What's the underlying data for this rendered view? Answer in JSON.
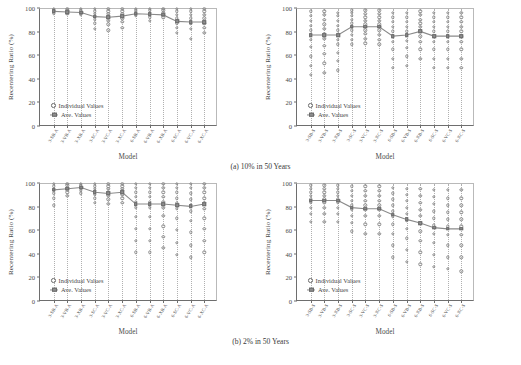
{
  "figure": {
    "subcaptions": [
      {
        "id": "a",
        "text": "(a) 10% in 50 Years"
      },
      {
        "id": "b",
        "text": "(b) 2% in 50 Years"
      }
    ]
  },
  "legend": {
    "individual_label": "Individual Values",
    "average_label": "Ave. Values"
  },
  "axis": {
    "ylabel": "Recentering Ratio (%)",
    "xlabel": "Model",
    "yticks": [
      0,
      20,
      40,
      60,
      80,
      100
    ],
    "ylim": [
      0,
      100
    ]
  },
  "colors": {
    "marker_edge": "#8a8a8a",
    "average_fill": "#8f8f8f",
    "line": "#8a8a8a",
    "grid": "#b0b0b0",
    "axis": "#6e6e6e",
    "text": "#4a4a4a"
  },
  "chart_data": [
    {
      "id": "panel-a-left",
      "type": "scatter",
      "title": "",
      "xlabel": "Model",
      "ylabel": "Recentering Ratio (%)",
      "ylim": [
        0,
        100
      ],
      "grid": true,
      "legend_position": "lower-left",
      "categories": [
        "3-SB-A",
        "3-VB-A",
        "3-XB-A",
        "3-SC-A",
        "3-VC-A",
        "3-XC-A",
        "6-SB-A",
        "6-VB-A",
        "6-XB-A",
        "6-SC-A",
        "6-VC-A",
        "6-XC-A"
      ],
      "series": [
        {
          "name": "Ave. Values",
          "values": [
            98,
            97.5,
            97,
            93.5,
            93,
            94,
            96,
            95.5,
            95,
            89.5,
            89,
            89
          ]
        }
      ],
      "individual_values": [
        [
          100,
          99,
          98.5,
          98,
          97.5,
          96.5
        ],
        [
          100,
          99,
          98,
          97.5,
          97,
          96
        ],
        [
          100,
          99,
          98,
          97,
          96.5,
          95
        ],
        [
          100,
          98,
          96,
          94,
          91,
          88,
          83
        ],
        [
          100,
          98,
          96,
          93,
          90,
          87,
          82
        ],
        [
          100,
          98,
          96,
          94,
          92,
          89,
          84
        ],
        [
          100,
          99,
          97.5,
          96.5,
          95.5,
          94
        ],
        [
          100,
          99,
          97,
          96,
          95,
          93,
          90
        ],
        [
          100,
          99,
          97,
          96,
          94.5,
          93
        ],
        [
          100,
          98,
          95,
          92,
          88,
          84,
          80
        ],
        [
          100,
          98,
          95,
          92,
          88,
          83,
          75
        ],
        [
          100,
          98,
          95,
          92,
          88,
          84,
          80
        ]
      ]
    },
    {
      "id": "panel-a-right",
      "type": "scatter",
      "title": "",
      "xlabel": "Model",
      "ylabel": "Recentering Ratio (%)",
      "ylim": [
        0,
        100
      ],
      "grid": true,
      "legend_position": "lower-left",
      "categories": [
        "3-SB-S",
        "3-VB-S",
        "3-XB-S",
        "3-SC-S",
        "3-VC-S",
        "3-XC-S",
        "6-SB-S",
        "6-VB-S",
        "6-XB-S",
        "6-SC-S",
        "6-VC-S",
        "6-XC-S"
      ],
      "series": [
        {
          "name": "Ave. Values",
          "values": [
            78,
            78,
            78,
            85,
            85,
            85,
            77,
            78,
            81,
            77,
            77,
            77
          ]
        }
      ],
      "individual_values": [
        [
          98,
          94,
          90,
          86,
          82,
          78,
          74,
          68,
          60,
          52,
          44
        ],
        [
          98,
          95,
          91,
          87,
          83,
          79,
          75,
          69,
          62,
          54,
          46
        ],
        [
          97,
          94,
          90,
          86,
          82,
          78,
          74,
          70,
          63,
          56,
          48
        ],
        [
          99,
          97,
          94,
          91,
          88,
          85,
          82,
          78,
          74,
          70
        ],
        [
          99,
          96,
          93,
          90,
          87,
          85,
          82,
          79,
          75,
          71
        ],
        [
          99,
          96,
          93,
          90,
          87,
          85,
          82,
          78,
          74,
          70
        ],
        [
          97,
          93,
          89,
          85,
          81,
          77,
          72,
          66,
          58,
          50
        ],
        [
          97,
          93,
          89,
          85,
          81,
          78,
          73,
          67,
          60,
          52
        ],
        [
          98,
          95,
          91,
          88,
          85,
          81,
          77,
          72,
          66,
          58
        ],
        [
          97,
          93,
          89,
          85,
          81,
          77,
          72,
          66,
          58,
          50
        ],
        [
          97,
          93,
          89,
          85,
          81,
          77,
          72,
          66,
          58,
          50
        ],
        [
          97,
          93,
          89,
          85,
          81,
          77,
          72,
          66,
          58,
          50
        ]
      ]
    },
    {
      "id": "panel-b-left",
      "type": "scatter",
      "title": "",
      "xlabel": "Model",
      "ylabel": "Recentering Ratio (%)",
      "ylim": [
        0,
        100
      ],
      "grid": true,
      "legend_position": "lower-left",
      "categories": [
        "3-SB-A",
        "3-VB-A",
        "3-XB-A",
        "3-SC-A",
        "3-VC-A",
        "3-XC-A",
        "6-SB-A",
        "6-VB-A",
        "6-XB-A",
        "6-SC-A",
        "6-VC-A",
        "6-XC-A"
      ],
      "series": [
        {
          "name": "Ave. Values",
          "values": [
            95,
            96,
            97,
            93,
            92,
            93,
            83,
            83,
            83,
            82,
            81,
            83
          ]
        }
      ],
      "individual_values": [
        [
          100,
          98,
          96,
          94,
          92,
          88,
          82
        ],
        [
          100,
          99,
          97,
          95,
          93,
          90
        ],
        [
          100,
          99,
          98,
          96,
          94,
          92
        ],
        [
          100,
          98,
          96,
          94,
          91,
          88,
          84
        ],
        [
          100,
          98,
          96,
          93,
          90,
          87,
          83
        ],
        [
          100,
          98,
          96,
          94,
          91,
          88,
          84
        ],
        [
          100,
          97,
          93,
          89,
          85,
          80,
          72,
          62,
          52,
          42
        ],
        [
          100,
          97,
          93,
          89,
          85,
          80,
          72,
          62,
          52,
          42
        ],
        [
          100,
          97,
          93,
          89,
          85,
          80,
          73,
          64,
          55,
          46
        ],
        [
          100,
          97,
          93,
          88,
          84,
          79,
          71,
          61,
          50,
          40
        ],
        [
          100,
          97,
          92,
          87,
          82,
          77,
          69,
          59,
          48,
          38
        ],
        [
          100,
          97,
          93,
          88,
          84,
          79,
          71,
          62,
          52,
          42
        ]
      ]
    },
    {
      "id": "panel-b-right",
      "type": "scatter",
      "title": "",
      "xlabel": "Model",
      "ylabel": "Recentering Ratio (%)",
      "ylim": [
        0,
        100
      ],
      "grid": true,
      "legend_position": "lower-left",
      "categories": [
        "3-SB-S",
        "3-VB-S",
        "3-XB-S",
        "3-SC-S",
        "3-VC-S",
        "3-XC-S",
        "6-SB-S",
        "6-VB-S",
        "6-XB-S",
        "6-SC-S",
        "6-VC-S",
        "6-XC-S"
      ],
      "series": [
        {
          "name": "Ave. Values",
          "values": [
            86,
            86,
            86,
            80,
            79,
            79,
            74,
            70,
            67,
            63,
            62,
            62
          ]
        }
      ],
      "individual_values": [
        [
          99,
          96,
          93,
          90,
          87,
          84,
          80,
          75,
          68
        ],
        [
          99,
          96,
          93,
          90,
          87,
          84,
          80,
          75,
          68
        ],
        [
          99,
          96,
          93,
          90,
          87,
          84,
          80,
          75,
          68
        ],
        [
          98,
          94,
          90,
          86,
          82,
          78,
          73,
          67,
          60
        ],
        [
          98,
          94,
          90,
          86,
          82,
          78,
          73,
          66,
          58
        ],
        [
          98,
          94,
          90,
          86,
          82,
          78,
          73,
          66,
          58
        ],
        [
          97,
          92,
          87,
          82,
          77,
          72,
          66,
          58,
          48,
          38
        ],
        [
          96,
          91,
          86,
          80,
          75,
          69,
          62,
          54,
          44,
          34
        ],
        [
          96,
          90,
          84,
          78,
          73,
          67,
          60,
          52,
          42,
          32
        ],
        [
          95,
          89,
          83,
          77,
          71,
          65,
          58,
          50,
          40,
          30
        ],
        [
          95,
          88,
          82,
          76,
          70,
          64,
          57,
          48,
          38,
          28
        ],
        [
          95,
          88,
          82,
          76,
          70,
          64,
          57,
          48,
          38,
          26
        ]
      ]
    }
  ]
}
